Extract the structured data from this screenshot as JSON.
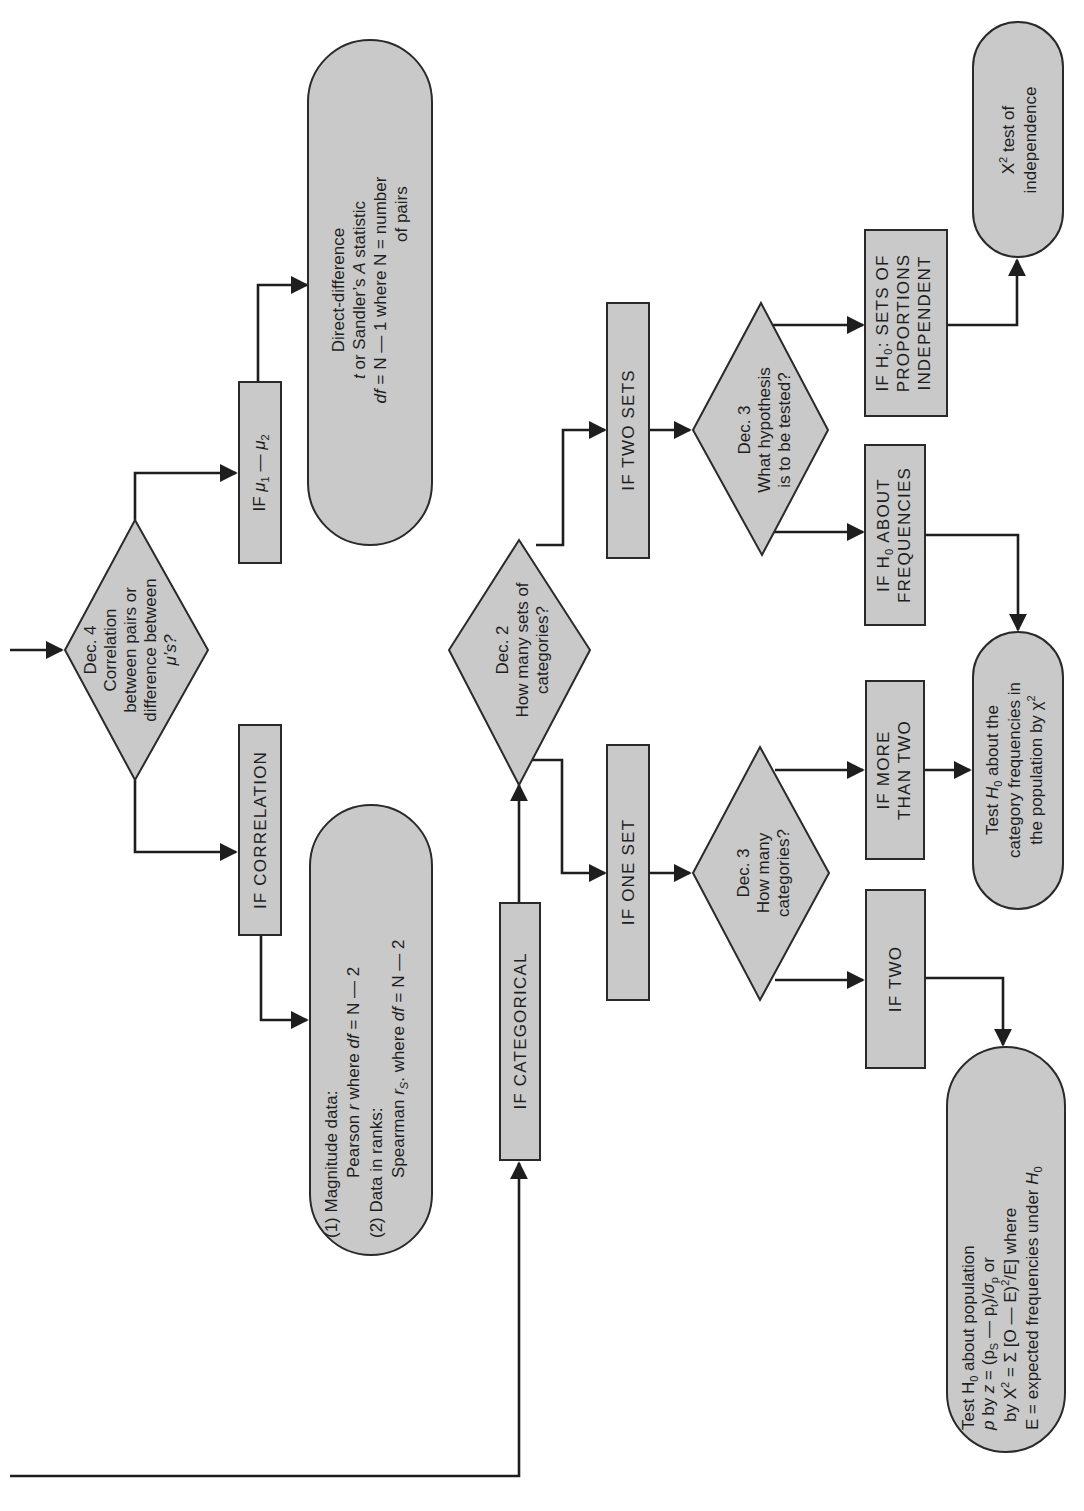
{
  "diagram": {
    "orientation": "rotated 90 degrees counter-clockwise",
    "colors": {
      "shape_fill": "#c9c9c9",
      "stroke": "#2a2a2a",
      "background": "#ffffff"
    },
    "decisions": {
      "dec4": {
        "lines": [
          "Dec. 4",
          "Correlation",
          "between pairs or",
          "difference between",
          "μ’s?"
        ]
      },
      "dec2": {
        "lines": [
          "Dec. 2",
          "How many sets of",
          "categories?"
        ]
      },
      "dec3_hypothesis": {
        "lines": [
          "Dec. 3",
          "What hypothesis",
          "is to be tested?"
        ]
      },
      "dec3_categories": {
        "lines": [
          "Dec. 3",
          "How many",
          "categories?"
        ]
      }
    },
    "conditions": {
      "mu_diff": {
        "prefix": "IF ",
        "mu": "μ",
        "sub1": "1",
        "minus": " — ",
        "sub2": "2"
      },
      "correlation": {
        "label": "IF CORRELATION"
      },
      "categorical": {
        "label": "IF CATEGORICAL"
      },
      "one_set": {
        "label": "IF ONE SET"
      },
      "two_sets": {
        "label": "IF TWO SETS"
      },
      "h0_frequencies": {
        "line1_prefix": "IF H",
        "line1_sub": "0",
        "line1_suffix": " ABOUT",
        "line2": "FREQUENCIES"
      },
      "h0_independent": {
        "line1_prefix": "IF H",
        "line1_sub": "0",
        "line1_suffix": ":  SETS OF",
        "line2": "PROPORTIONS",
        "line3": "INDEPENDENT"
      },
      "more_than_two": {
        "line1": "IF MORE",
        "line2": "THAN TWO"
      },
      "two": {
        "label": "IF TWO"
      }
    },
    "outcomes": {
      "direct_difference": {
        "line1": "Direct-difference",
        "line2_t": "t",
        "line2_rest": " or Sandler’s ",
        "line2_A": "A",
        "line2_end": " statistic",
        "line3_df": "df",
        "line3_rest": " = N — 1  where N = number",
        "line4": "of pairs"
      },
      "correlation_tests": {
        "line1": "(1)  Magnitude data:",
        "line2_a": "Pearson ",
        "line2_r": "r",
        "line2_b": " where ",
        "line2_df": "df",
        "line2_c": " = N — 2",
        "line3": "(2)  Data in ranks:",
        "line4_a": "Spearman ",
        "line4_r": "r",
        "line4_S": "S",
        "line4_b": ".  where ",
        "line4_df": "df",
        "line4_c": " = N — 2"
      },
      "chi_square_independence": {
        "line1_X": "X",
        "line1_sup": "2",
        "line1_rest": "  test of",
        "line2": "independence"
      },
      "category_frequencies": {
        "line1_a": "Test ",
        "line1_H": "H",
        "line1_sub": "0",
        "line1_b": " about the",
        "line2": "category frequencies in",
        "line3_a": "the population by ",
        "line3_chi": "χ",
        "line3_sup": "2"
      },
      "population_proportion": {
        "line1_a": "Test H",
        "line1_sub": "0",
        "line1_b": " about population",
        "line2_p": "p",
        "line2_a": " by ",
        "line2_z": "z",
        "line2_b": " = (p",
        "line2_sS": "S",
        "line2_c": " — p",
        "line2_st": "t",
        "line2_d": ")/",
        "line2_sigma": "σ",
        "line2_sp": "p",
        "line2_e": " or",
        "line3_a": "by X",
        "line3_sup": "2",
        "line3_b": " = Σ [O — E)",
        "line3_sup2": "2",
        "line3_c": "/E]  where",
        "line4_a": "E = expected frequencies under ",
        "line4_H": "H",
        "line4_sub": "0"
      }
    }
  }
}
